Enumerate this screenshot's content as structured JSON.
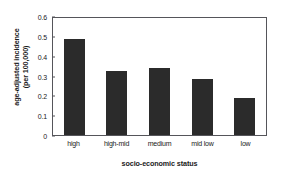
{
  "chart_data": {
    "type": "bar",
    "title": "",
    "categories": [
      "high",
      "high-mid",
      "medium",
      "mid low",
      "low"
    ],
    "values": [
      0.485,
      0.325,
      0.34,
      0.28,
      0.185
    ],
    "xlabel": "socio-economic status",
    "ylabel_line1": "age-adjusted incidence",
    "ylabel_line2": "(per 100,000)",
    "ylim": [
      0,
      0.6
    ],
    "yticks": [
      "0",
      "0.1",
      "0.2",
      "0.3",
      "0.4",
      "0.5",
      "0.6"
    ],
    "ytick_values": [
      0,
      0.1,
      0.2,
      0.3,
      0.4,
      0.5,
      0.6
    ],
    "grid": false,
    "legend": "none",
    "bar_color": "#2b2b2b",
    "axis_color": "#55555a",
    "background": "#ffffff"
  }
}
